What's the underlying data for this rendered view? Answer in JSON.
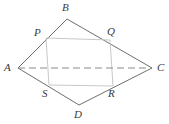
{
  "figure": {
    "name": "quadrilateral-midpoint-parallelogram-diagram",
    "background_color": "#ffffff",
    "outline_color": "#6e6e6e",
    "inner_color": "#c9c9c9",
    "dashed_color": "#8a8a8a",
    "label_color": "#3a3a3a",
    "outer_polygon": {
      "name": "ABCD",
      "vertices": [
        "A",
        "B",
        "C",
        "D"
      ]
    },
    "inner_polygon": {
      "name": "PQRS",
      "vertices": [
        "P",
        "Q",
        "R",
        "S"
      ]
    },
    "diagonal": {
      "name": "AC",
      "style": "dashed",
      "from": "A",
      "to": "C"
    },
    "points": [
      {
        "id": "A",
        "label": "A",
        "x": 18,
        "y": 68,
        "label_x": 4,
        "label_y": 62
      },
      {
        "id": "B",
        "label": "B",
        "x": 67,
        "y": 19,
        "label_x": 62,
        "label_y": 2
      },
      {
        "id": "C",
        "label": "C",
        "x": 152,
        "y": 68,
        "label_x": 157,
        "label_y": 62
      },
      {
        "id": "D",
        "label": "D",
        "x": 79,
        "y": 105,
        "label_x": 74,
        "label_y": 109
      },
      {
        "id": "P",
        "label": "P",
        "x": 46,
        "y": 38,
        "label_x": 34,
        "label_y": 27
      },
      {
        "id": "Q",
        "label": "Q",
        "x": 110,
        "y": 40,
        "label_x": 107,
        "label_y": 26
      },
      {
        "id": "R",
        "label": "R",
        "x": 113,
        "y": 86,
        "label_x": 108,
        "label_y": 88
      },
      {
        "id": "S",
        "label": "S",
        "x": 49,
        "y": 85,
        "label_x": 42,
        "label_y": 88
      }
    ]
  }
}
